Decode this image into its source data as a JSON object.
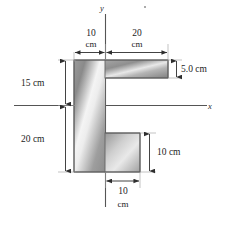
{
  "figure": {
    "type": "engineering-cross-section-diagram",
    "axes": {
      "x_label": "x",
      "y_label": "y",
      "origin_x_px": 105,
      "origin_y_px": 105
    },
    "dimensions": [
      {
        "id": "top-left-width",
        "value": "10",
        "unit": "cm",
        "line1": "10",
        "line2": "cm"
      },
      {
        "id": "top-right-width",
        "value": "20",
        "unit": "cm",
        "line1": "20",
        "line2": "cm"
      },
      {
        "id": "top-flange-thick",
        "value": "5.0 cm",
        "unit": "cm",
        "line1": "5.0 cm",
        "line2": ""
      },
      {
        "id": "upper-left-height",
        "value": "15 cm",
        "unit": "cm",
        "line1": "15 cm",
        "line2": ""
      },
      {
        "id": "lower-left-height",
        "value": "20 cm",
        "unit": "cm",
        "line1": "20 cm",
        "line2": ""
      },
      {
        "id": "bottom-tab-height",
        "value": "10 cm",
        "unit": "cm",
        "line1": "10 cm",
        "line2": ""
      },
      {
        "id": "bottom-tab-width",
        "value": "10",
        "unit": "cm",
        "line1": "10",
        "line2": "cm"
      }
    ],
    "colors": {
      "fill_light": "#f2f2f2",
      "fill_mid": "#b8b8b8",
      "fill_dark": "#7d7d7d",
      "outline": "#5a5a5a",
      "axis": "#4a4a4a",
      "dimension_line": "#3a3a3a",
      "text": "#1c1c1c"
    },
    "caption": ""
  }
}
